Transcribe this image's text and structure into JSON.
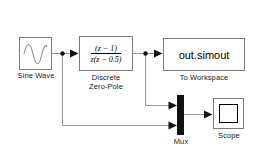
{
  "diagram": {
    "background_color": "#ffffff",
    "line_color": "#9a9a9a",
    "block_border_color": "#7a7a7a",
    "mux_color": "#111111"
  },
  "blocks": {
    "sine_wave": {
      "label": "Sine Wave",
      "icon": "sine-wave-icon"
    },
    "zero_pole": {
      "label": "Discrete\nZero-Pole",
      "numerator": "(z − 1)",
      "denominator": "z(z − 0.5)"
    },
    "to_workspace": {
      "value": "out.simout",
      "label": "To Workspace"
    },
    "mux": {
      "label": "Mux",
      "inputs": 2
    },
    "scope": {
      "label": "Scope",
      "icon": "scope-screen-icon"
    }
  },
  "signals": [
    {
      "from": "sine_wave",
      "to": "zero_pole"
    },
    {
      "from": "sine_wave",
      "to": "mux",
      "port": 2
    },
    {
      "from": "zero_pole",
      "to": "to_workspace"
    },
    {
      "from": "zero_pole",
      "to": "mux",
      "port": 1
    },
    {
      "from": "mux",
      "to": "scope"
    }
  ]
}
